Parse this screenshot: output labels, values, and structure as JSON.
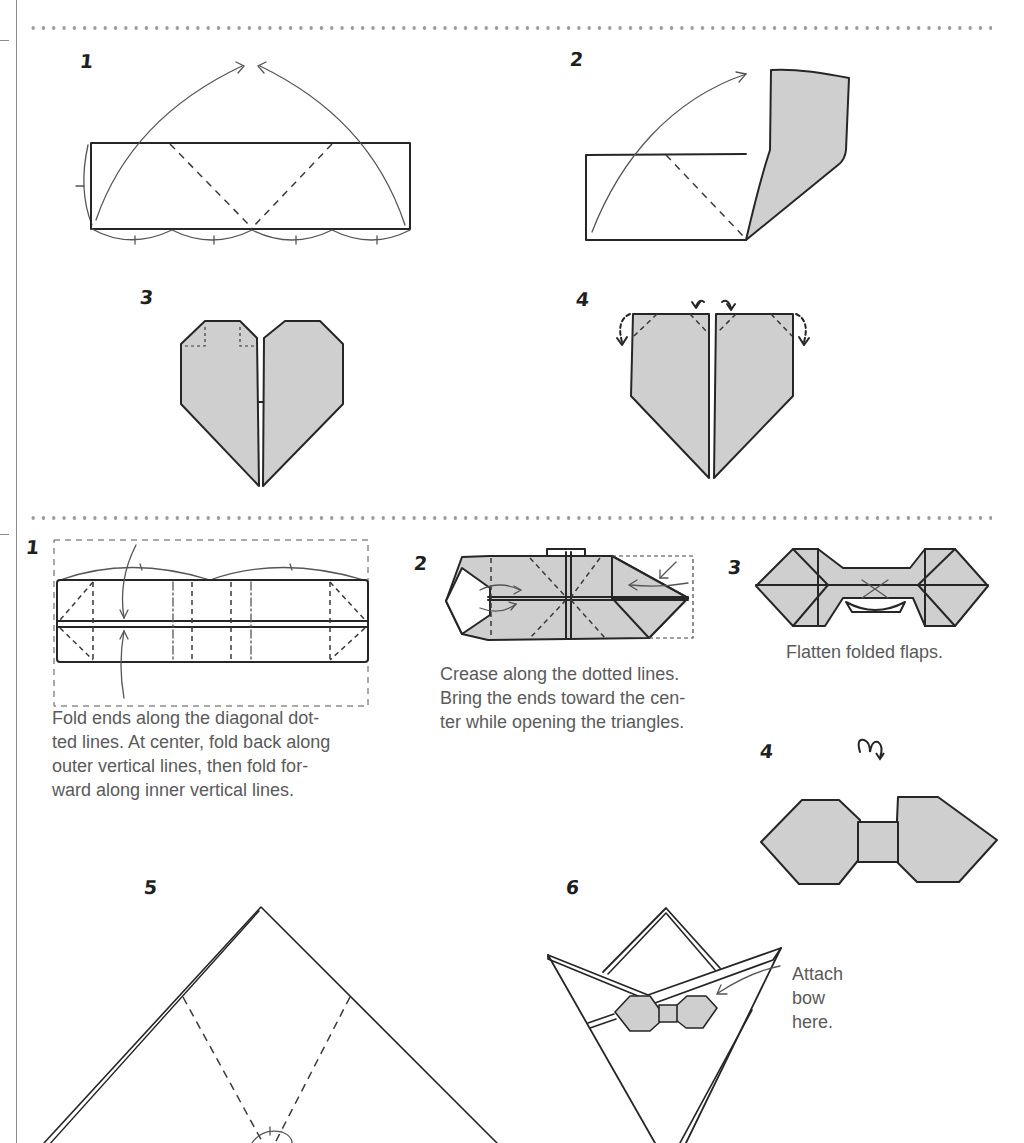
{
  "colors": {
    "paper": "#ffffff",
    "ink": "#262626",
    "shade": "#cfcfcf",
    "caption_text": "#5a5a5a",
    "dotted_rule": "#9a9a9a"
  },
  "heart_section": {
    "steps": [
      {
        "number": "1",
        "diagram": "rectangle-with-diagonal-creases-and-fold-arrows"
      },
      {
        "number": "2",
        "diagram": "rectangle-with-right-flap-folded-up"
      },
      {
        "number": "3",
        "diagram": "heart-shape"
      },
      {
        "number": "4",
        "diagram": "pentagon-heart-base-with-corner-fold-arrows"
      }
    ]
  },
  "bow_section": {
    "steps": [
      {
        "number": "1",
        "diagram": "long-strip-with-creases",
        "caption_lines": [
          "Fold ends along the diagonal dot-",
          "ted lines. At center, fold back along",
          "outer vertical lines, then fold for-",
          "ward along inner vertical lines."
        ]
      },
      {
        "number": "2",
        "diagram": "folded-strip-with-triangles",
        "caption_lines": [
          "Crease along the dotted lines.",
          "Bring the ends toward the cen-",
          "ter while opening the triangles."
        ]
      },
      {
        "number": "3",
        "diagram": "bow-with-folded-flaps",
        "caption_lines": [
          "Flatten folded flaps."
        ]
      },
      {
        "number": "4",
        "diagram": "finished-bow",
        "symbol": "turn-over-icon"
      }
    ]
  },
  "shirt_section": {
    "steps": [
      {
        "number": "5",
        "diagram": "large-triangle-with-crease-lines"
      },
      {
        "number": "6",
        "diagram": "shirt-collar-with-bow",
        "caption_lines": [
          "Attach",
          "bow",
          "here."
        ]
      }
    ]
  }
}
